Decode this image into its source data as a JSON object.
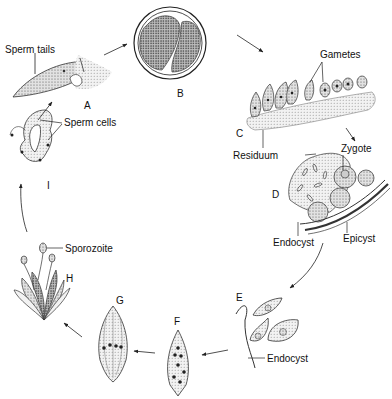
{
  "diagram": {
    "type": "life-cycle",
    "stages": [
      {
        "id": "A",
        "letter": "A",
        "labels": [
          "Sperm tails"
        ]
      },
      {
        "id": "B",
        "letter": "B",
        "labels": []
      },
      {
        "id": "C",
        "letter": "C",
        "labels": [
          "Gametes",
          "Residuum"
        ]
      },
      {
        "id": "D",
        "letter": "D",
        "labels": [
          "Zygote",
          "Endocyst",
          "Epicyst"
        ]
      },
      {
        "id": "E",
        "letter": "E",
        "labels": [
          "Endocyst"
        ]
      },
      {
        "id": "F",
        "letter": "F",
        "labels": []
      },
      {
        "id": "G",
        "letter": "G",
        "labels": []
      },
      {
        "id": "H",
        "letter": "H",
        "labels": [
          "Sporozoite"
        ]
      },
      {
        "id": "I",
        "letter": "I",
        "labels": [
          "Sperm cells"
        ]
      }
    ],
    "sequence": [
      "A",
      "B",
      "C",
      "D",
      "E",
      "F",
      "G",
      "H",
      "I",
      "A"
    ],
    "labels": {
      "sperm_tails": "Sperm tails",
      "gametes": "Gametes",
      "residuum": "Residuum",
      "zygote": "Zygote",
      "endocyst_d": "Endocyst",
      "epicyst": "Epicyst",
      "endocyst_e": "Endocyst",
      "sporozoite": "Sporozoite",
      "sperm_cells": "Sperm cells"
    },
    "colors": {
      "line": "#222222",
      "stipple": "#9a9a9a",
      "fill_light": "#e6e6e6",
      "background": "#ffffff"
    }
  }
}
